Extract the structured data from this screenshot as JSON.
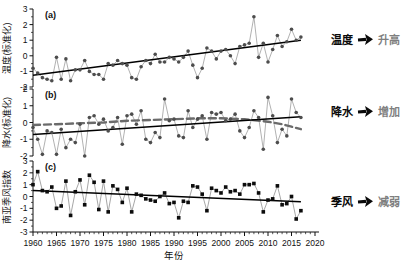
{
  "figure": {
    "background": "#ffffff",
    "xlabel": "年份",
    "x_ticks": [
      1960,
      1965,
      1970,
      1975,
      1980,
      1985,
      1990,
      1995,
      2000,
      2005,
      2010,
      2015,
      2020
    ],
    "x_range": [
      1960,
      2020
    ]
  },
  "chart_data": [
    {
      "id": "a",
      "type": "line",
      "tag": "(a)",
      "ylabel": "温度(标准化)",
      "ylim": [
        -2,
        3
      ],
      "y_ticks": [
        3,
        2,
        1,
        0,
        -1,
        -2
      ],
      "marker": "circle",
      "marker_color": "#4d4d4d",
      "connect_color": "#9d9d9d",
      "x_start": 1960,
      "values": [
        -0.8,
        -1.1,
        -1.4,
        -1.5,
        -1.6,
        -0.1,
        -1.5,
        -0.2,
        -1.6,
        -0.9,
        -0.9,
        -0.3,
        -1.0,
        -1.2,
        -1.2,
        -1.5,
        -0.5,
        -0.6,
        -0.3,
        -0.5,
        -0.6,
        -1.4,
        -1.5,
        -0.7,
        -0.3,
        -0.5,
        0.1,
        -0.4,
        -0.4,
        -0.1,
        -0.2,
        -0.4,
        -0.1,
        0.3,
        -0.6,
        -1.4,
        -0.8,
        0.5,
        0.3,
        -0.2,
        0.3,
        0.4,
        0.0,
        -0.5,
        0.6,
        0.7,
        0.8,
        2.5,
        -0.1,
        0.8,
        -0.4,
        0.4,
        1.3,
        0.6,
        0.9,
        1.7,
        1.0,
        1.2
      ],
      "trend": {
        "x": [
          1960,
          2017
        ],
        "y": [
          -1.25,
          1.0
        ],
        "color": "#000000",
        "style": "solid"
      }
    },
    {
      "id": "b",
      "type": "line",
      "tag": "(b)",
      "ylabel": "降水(标准化)",
      "ylim": [
        -2,
        2
      ],
      "y_ticks": [
        2,
        1,
        0,
        -1,
        -2
      ],
      "marker": "circle",
      "marker_color": "#4d4d4d",
      "connect_color": "#9d9d9d",
      "x_start": 1960,
      "values": [
        -0.3,
        -1.0,
        -1.9,
        -0.5,
        -0.6,
        -1.9,
        -0.4,
        -1.5,
        -1.0,
        -1.2,
        -0.1,
        -2.0,
        0.3,
        0.4,
        -0.1,
        0.2,
        -0.5,
        -0.3,
        0.3,
        -1.3,
        0.4,
        0.5,
        -0.1,
        0.7,
        -1.0,
        -1.2,
        -0.6,
        -0.9,
        1.4,
        0.1,
        0.2,
        -0.8,
        -0.9,
        0.7,
        -0.3,
        0.2,
        0.4,
        -1.0,
        0.6,
        0.5,
        0.6,
        0.1,
        0.2,
        0.5,
        -0.5,
        -0.9,
        -0.3,
        0.7,
        0.3,
        -1.6,
        1.5,
        0.4,
        -1.2,
        -0.4,
        -0.8,
        1.4,
        0.6,
        0.3
      ],
      "trend": {
        "x": [
          1960,
          2017
        ],
        "y": [
          -0.72,
          0.35
        ],
        "color": "#000000",
        "style": "solid"
      },
      "smooth": {
        "x": [
          1960,
          1965,
          1970,
          1975,
          1980,
          1985,
          1990,
          1995,
          2000,
          2005,
          2010,
          2013,
          2015,
          2017
        ],
        "y": [
          -0.15,
          -0.1,
          -0.05,
          0.0,
          0.1,
          0.15,
          0.2,
          0.25,
          0.25,
          0.2,
          0.05,
          -0.1,
          -0.25,
          -0.4
        ],
        "color": "#6b6b6b",
        "style": "dashed"
      }
    },
    {
      "id": "c",
      "type": "line",
      "tag": "(c)",
      "ylabel": "南亚季风指数",
      "ylim": [
        -3,
        3
      ],
      "y_ticks": [
        3,
        2,
        1,
        0,
        -1,
        -2,
        -3
      ],
      "marker": "square",
      "marker_color": "#0c0c0c",
      "connect_color": "#8f8f8f",
      "x_start": 1960,
      "values": [
        1.0,
        2.1,
        0.5,
        0.4,
        0.8,
        -1.0,
        -0.8,
        1.3,
        -1.6,
        0.4,
        1.4,
        -0.7,
        1.8,
        1.2,
        -1.1,
        1.3,
        -1.3,
        0.9,
        0.6,
        -0.5,
        0.7,
        -1.3,
        0.2,
        0.1,
        -0.2,
        -0.3,
        -0.4,
        0.0,
        0.3,
        -0.6,
        -0.5,
        -1.8,
        -0.4,
        -0.5,
        0.9,
        0.8,
        0.2,
        -1.2,
        0.7,
        0.5,
        0.3,
        0.8,
        0.4,
        0.5,
        0.2,
        1.0,
        1.0,
        1.1,
        0.3,
        -1.3,
        -0.3,
        -0.2,
        0.9,
        -0.7,
        -0.6,
        0.0,
        -1.9,
        -1.2
      ],
      "trend": {
        "x": [
          1960,
          2017
        ],
        "y": [
          0.5,
          -0.45
        ],
        "color": "#000000",
        "style": "solid"
      }
    }
  ],
  "annotations": [
    {
      "label": "温度",
      "result": "升高"
    },
    {
      "label": "降水",
      "result": "增加"
    },
    {
      "label": "季风",
      "result": "减弱"
    }
  ],
  "colors": {
    "axis": "#111111",
    "tick_text": "#111111",
    "annotation_result": "#7f7f7f",
    "arrow": "#0a0a0a"
  }
}
